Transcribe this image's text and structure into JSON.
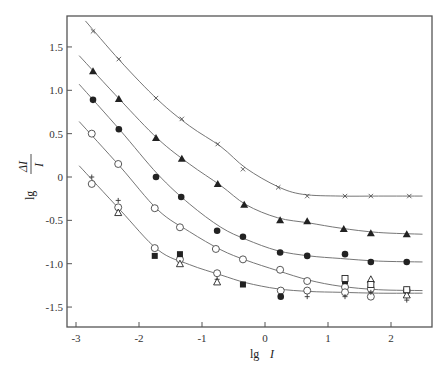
{
  "chart_data": {
    "type": "scatter",
    "title": "",
    "xlabel": "lg I",
    "ylabel": "lg ΔI/I",
    "xlim": [
      -3.15,
      2.65
    ],
    "ylim": [
      -1.72,
      1.85
    ],
    "x_ticks": [
      -3,
      -2,
      -1,
      0,
      1,
      2
    ],
    "x_tick_labels": [
      "-3",
      "-2",
      "-1",
      "0",
      "1",
      "2"
    ],
    "y_ticks": [
      1.5,
      1.0,
      0.5,
      0,
      -0.5,
      -1.0,
      -1.5
    ],
    "y_tick_labels": [
      "1.5",
      "1.0",
      "0.5",
      "0",
      "-0.5",
      "-1.0",
      "-1.5"
    ],
    "grid": false,
    "legend": "none",
    "series": [
      {
        "name": "cross",
        "marker": "x",
        "x": [
          -2.73,
          -2.32,
          -1.73,
          -1.32,
          -0.75,
          -0.35,
          0.21,
          0.67,
          1.27,
          1.68,
          2.29
        ],
        "y": [
          1.68,
          1.36,
          0.91,
          0.67,
          0.38,
          0.09,
          -0.12,
          -0.22,
          -0.22,
          -0.22,
          -0.22
        ]
      },
      {
        "name": "filled-triangle",
        "marker": "filled-triangle",
        "x": [
          -2.73,
          -2.32,
          -1.73,
          -1.32,
          -0.75,
          -0.33,
          0.24,
          0.67,
          1.25,
          1.68,
          2.25
        ],
        "y": [
          1.22,
          0.9,
          0.45,
          0.21,
          -0.08,
          -0.32,
          -0.5,
          -0.51,
          -0.6,
          -0.65,
          -0.66
        ]
      },
      {
        "name": "filled-circle",
        "marker": "filled-circle",
        "x": [
          -2.73,
          -2.32,
          -1.73,
          -1.33,
          -0.76,
          -0.35,
          0.24,
          0.67,
          1.27,
          1.68,
          2.25
        ],
        "y": [
          0.89,
          0.55,
          0.0,
          -0.23,
          -0.62,
          -0.69,
          -0.87,
          -0.91,
          -0.89,
          -0.98,
          -0.98
        ]
      },
      {
        "name": "open-circle-upper",
        "marker": "open-circle",
        "x": [
          -2.75,
          -2.33,
          -1.75,
          -1.35,
          -0.78,
          -0.35,
          0.24,
          0.67,
          1.27,
          1.68,
          2.25
        ],
        "y": [
          0.5,
          0.15,
          -0.36,
          -0.58,
          -0.83,
          -0.95,
          -1.07,
          -1.2,
          -1.27,
          -1.29,
          -1.31
        ]
      },
      {
        "name": "open-circle-lower",
        "marker": "open-circle",
        "x": [
          -2.75,
          -2.33,
          -1.75,
          -1.35,
          -0.76,
          0.25,
          0.67,
          1.27,
          1.68
        ],
        "y": [
          -0.08,
          -0.35,
          -0.82,
          -0.95,
          -1.11,
          -1.31,
          -1.31,
          -1.33,
          -1.38
        ]
      },
      {
        "name": "plus",
        "marker": "plus",
        "x": [
          -2.75,
          -2.33,
          -0.76,
          0.67,
          1.27,
          1.68,
          2.25
        ],
        "y": [
          0.0,
          -0.27,
          -1.18,
          -1.38,
          -1.38,
          -1.33,
          -1.42
        ]
      },
      {
        "name": "open-triangle",
        "marker": "open-triangle",
        "x": [
          -2.33,
          -1.35,
          -0.76,
          1.68,
          2.25
        ],
        "y": [
          -0.41,
          -1.0,
          -1.21,
          -1.18,
          -1.36
        ]
      },
      {
        "name": "filled-square",
        "marker": "filled-square",
        "x": [
          -1.75,
          -1.35,
          -0.35,
          1.27
        ],
        "y": [
          -0.91,
          -0.89,
          -1.24,
          -1.2
        ]
      },
      {
        "name": "open-square",
        "marker": "open-square",
        "x": [
          1.27,
          1.68,
          2.25
        ],
        "y": [
          -1.17,
          -1.24,
          -1.3
        ]
      },
      {
        "name": "filled-circle-lower",
        "marker": "filled-circle",
        "x": [
          0.25
        ],
        "y": [
          -1.38
        ]
      }
    ],
    "curves": [
      {
        "name": "fit-cross",
        "x": [
          -2.85,
          -2.3,
          -1.7,
          -1.2,
          -0.7,
          -0.3,
          0.2,
          0.6,
          1.2,
          1.8,
          2.5
        ],
        "y": [
          1.8,
          1.34,
          0.89,
          0.59,
          0.35,
          0.1,
          -0.11,
          -0.2,
          -0.22,
          -0.22,
          -0.22
        ]
      },
      {
        "name": "fit-filled-triangle",
        "x": [
          -2.95,
          -2.3,
          -1.7,
          -1.2,
          -0.7,
          -0.3,
          0.2,
          0.7,
          1.2,
          1.8,
          2.5
        ],
        "y": [
          1.4,
          0.89,
          0.44,
          0.15,
          -0.1,
          -0.32,
          -0.47,
          -0.53,
          -0.59,
          -0.64,
          -0.66
        ]
      },
      {
        "name": "fit-filled-circle",
        "x": [
          -2.95,
          -2.3,
          -1.7,
          -1.2,
          -0.7,
          -0.3,
          0.2,
          0.7,
          1.2,
          1.8,
          2.5
        ],
        "y": [
          1.07,
          0.54,
          0.03,
          -0.31,
          -0.58,
          -0.72,
          -0.85,
          -0.91,
          -0.94,
          -0.97,
          -0.98
        ]
      },
      {
        "name": "fit-open-circle-upper",
        "x": [
          -2.95,
          -2.3,
          -1.7,
          -1.2,
          -0.7,
          -0.3,
          0.2,
          0.7,
          1.2,
          1.8,
          2.5
        ],
        "y": [
          0.64,
          0.12,
          -0.38,
          -0.63,
          -0.84,
          -0.96,
          -1.08,
          -1.19,
          -1.26,
          -1.3,
          -1.31
        ]
      },
      {
        "name": "fit-open-circle-lower",
        "x": [
          -2.95,
          -2.3,
          -1.7,
          -1.2,
          -0.7,
          -0.3,
          0.2,
          0.7,
          1.2,
          1.8,
          2.5
        ],
        "y": [
          0.13,
          -0.38,
          -0.84,
          -1.01,
          -1.13,
          -1.22,
          -1.29,
          -1.32,
          -1.33,
          -1.34,
          -1.34
        ]
      }
    ]
  },
  "axes": {
    "xlabel_main": "lg",
    "xlabel_var": "I",
    "ylabel_main": "lg",
    "ylabel_num": "ΔI",
    "ylabel_den": "I"
  }
}
